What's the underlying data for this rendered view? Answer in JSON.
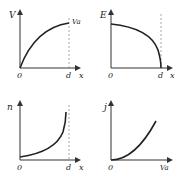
{
  "panels": [
    {
      "id": "V-x",
      "ylabel": "V",
      "xlabel": "x",
      "origin": "0",
      "xmark": "d",
      "curve_end_label": "Va"
    },
    {
      "id": "E-x",
      "ylabel": "E",
      "xlabel": "x",
      "origin": "0",
      "xmark": "d"
    },
    {
      "id": "n-x",
      "ylabel": "n",
      "xlabel": "x",
      "origin": "0",
      "xmark": "d"
    },
    {
      "id": "j-Va",
      "ylabel": "j",
      "xlabel": "Va",
      "origin": "0"
    }
  ],
  "colors": {
    "ink": "#222222",
    "dashed": "#888888"
  }
}
